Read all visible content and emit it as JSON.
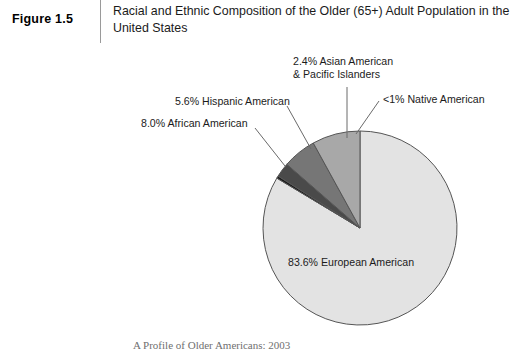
{
  "header": {
    "figure_number": "Figure 1.5",
    "title_line1": "Racial and Ethnic Composition of the Older (65+) Adult Population",
    "title_line2": "in the United States",
    "divider_color": "#9a9a9a"
  },
  "labels": {
    "asian_line1": "2.4% Asian American",
    "asian_line2": "& Pacific Islanders",
    "native": "<1% Native American",
    "hispanic": "5.6% Hispanic American",
    "african": "8.0% African American",
    "european": "83.6% European American"
  },
  "source": {
    "note": "A Profile of Older Americans: 2003"
  },
  "chart_data": {
    "type": "pie",
    "title": "Racial and Ethnic Composition of the Older (65+) Adult Population in the United States",
    "categories": [
      "European American",
      "Native American",
      "Asian American & Pacific Islanders",
      "Hispanic American",
      "African American"
    ],
    "values": [
      83.6,
      0.4,
      2.4,
      5.6,
      8.0
    ],
    "value_labels": [
      "83.6%",
      "<1%",
      "2.4%",
      "5.6%",
      "8.0%"
    ],
    "colors": [
      "#e3e3e3",
      "#1c1c1c",
      "#4a4a4a",
      "#767676",
      "#a8a8a8"
    ],
    "stroke": "#555555",
    "start_angle_deg": 90,
    "direction": "counterclockwise",
    "units": "percent",
    "legend": "none (direct callout labels with leader lines)",
    "grid": false,
    "source": "A Profile of Older Americans: 2003"
  }
}
